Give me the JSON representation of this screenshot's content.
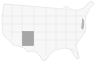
{
  "map": {
    "region": "United States",
    "highlighted_state": "New Mexico",
    "colors": {
      "background": "#ffffff",
      "land": "#f7f7f7",
      "border": "#d9d9d9",
      "highlight": "#a6a6a6",
      "highlight_border": "#8c8c8c",
      "east_coast_detail": "#9a9a9a"
    }
  }
}
